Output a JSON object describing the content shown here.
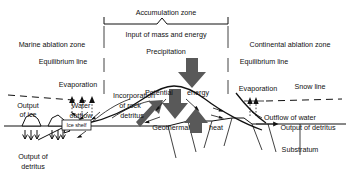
{
  "figure": {
    "background_color": "#ffffff",
    "ink_color": "#111111",
    "arrow_gray": "#595959"
  },
  "zones": {
    "accumulation": "Accumulation zone",
    "marine_ablation": "Marine ablation zone",
    "continental_ablation": "Continental ablation zone"
  },
  "labels": {
    "input": "Input of mass and energy",
    "precipitation": "Precipitation",
    "equilibrium_line_left": "Equilibrium line",
    "equilibrium_line_right": "Equilibrium line",
    "evaporation_left": "Evaporation",
    "evaporation_right": "Evaporation",
    "snow_line": "Snow line",
    "output_of_ice": "Output\nof ice",
    "output_of_ice_l1": "Output",
    "output_of_ice_l2": "of ice",
    "water_outflow_l1": "Water",
    "water_outflow_l2": "outflow",
    "incorporation_l1": "Incorporation",
    "incorporation_l2": "of rock",
    "incorporation_l3": "detritus",
    "potential": "Potential",
    "energy": "energy",
    "geothermal": "Geothermal",
    "heat": "heat",
    "ice_shelf": "Ice shelf",
    "output_of_detritus_left_l1": "Output of",
    "output_of_detritus_left_l2": "detritus",
    "outflow_of_water": "Outflow of water",
    "output_of_detritus_right": "Output of detritus",
    "substratum": "Substratum"
  }
}
